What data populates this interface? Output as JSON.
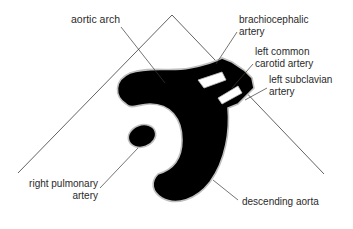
{
  "diagram": {
    "colors": {
      "vessel_fill": "#000000",
      "vessel_outline": "#bfbfbf",
      "leader_line": "#3a3a3a",
      "text": "#2a2a2a",
      "background": "#ffffff"
    },
    "labels": {
      "aortic_arch": "aortic arch",
      "brachiocephalic_1": "brachiocephalic",
      "brachiocephalic_2": "artery",
      "left_common_carotid_1": "left common",
      "left_common_carotid_2": "carotid artery",
      "left_subclavian_1": "left subclavian",
      "left_subclavian_2": "artery",
      "right_pulmonary_1": "right pulmonary",
      "right_pulmonary_2": "artery",
      "descending_aorta": "descending aorta"
    }
  }
}
